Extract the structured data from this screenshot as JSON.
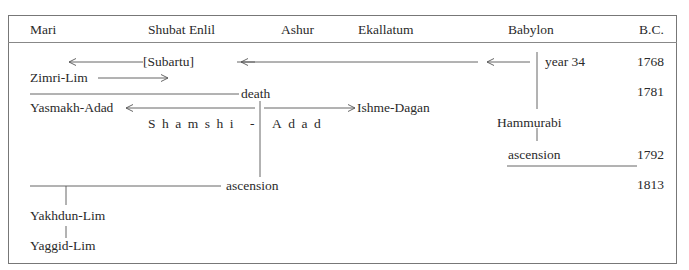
{
  "header": {
    "columns": [
      "Mari",
      "Shubat Enlil",
      "Ashur",
      "Ekallatum",
      "Babylon",
      "B.C."
    ]
  },
  "labels": {
    "subartu": "[Subartu]",
    "zimri_lim": "Zimri-Lim",
    "year34": "year 34",
    "death": "death",
    "yasmakh_adad": "Yasmakh-Adad",
    "ishme_dagan": "Ishme-Dagan",
    "shamshi": "Shamshi",
    "dash": "-",
    "adad": "Adad",
    "hammurabi": "Hammurabi",
    "hammurabi_ascension": "ascension",
    "shamshi_ascension": "ascension",
    "yakhdun_lim": "Yakhdun-Lim",
    "yaggid_lim": "Yaggid-Lim"
  },
  "years": [
    "1768",
    "1781",
    "1792",
    "1813"
  ],
  "colors": {
    "line": "#555555",
    "text": "#2a2a2a",
    "border": "#777777"
  }
}
